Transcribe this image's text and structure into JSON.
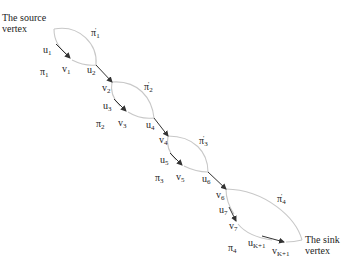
{
  "diagram": {
    "source_label": [
      "The source",
      "vertex"
    ],
    "sink_label": [
      "The sink",
      "vertex"
    ],
    "colors": {
      "curve": "#c8c8c8",
      "arrow": "#333333",
      "text": "#222222"
    },
    "segments": [
      {
        "from": "u1",
        "to": "v1"
      },
      {
        "from": "u2",
        "to": "v2"
      },
      {
        "from": "u3",
        "to": "v3"
      },
      {
        "from": "u4",
        "to": "v4"
      },
      {
        "from": "u5",
        "to": "v5"
      },
      {
        "from": "u6",
        "to": "v6"
      },
      {
        "from": "u7",
        "to": "v7"
      },
      {
        "from": "uK+1",
        "to": "vK+1"
      }
    ],
    "labels": {
      "u1": {
        "base": "u",
        "sub": "1"
      },
      "v1": {
        "base": "v",
        "sub": "1"
      },
      "u2": {
        "base": "u",
        "sub": "2"
      },
      "v2": {
        "base": "v",
        "sub": "2"
      },
      "u3": {
        "base": "u",
        "sub": "3"
      },
      "v3": {
        "base": "v",
        "sub": "3"
      },
      "u4": {
        "base": "u",
        "sub": "4"
      },
      "v4": {
        "base": "v",
        "sub": "4"
      },
      "u5": {
        "base": "u",
        "sub": "5"
      },
      "v5": {
        "base": "v",
        "sub": "5"
      },
      "u6": {
        "base": "u",
        "sub": "6"
      },
      "v6": {
        "base": "v",
        "sub": "6"
      },
      "u7": {
        "base": "u",
        "sub": "7"
      },
      "v7": {
        "base": "v",
        "sub": "7"
      },
      "uK1": {
        "base": "u",
        "sub": "K+1"
      },
      "vK1": {
        "base": "v",
        "sub": "K+1"
      },
      "pi1": {
        "base": "π",
        "sub": "1"
      },
      "pi2": {
        "base": "π",
        "sub": "2"
      },
      "pi3": {
        "base": "π",
        "sub": "3"
      },
      "pi4": {
        "base": "π",
        "sub": "4"
      },
      "pi1p": {
        "base": "π",
        "sup": "'",
        "sub": "1"
      },
      "pi2p": {
        "base": "π",
        "sup": "'",
        "sub": "2"
      },
      "pi3p": {
        "base": "π",
        "sup": "'",
        "sub": "3"
      },
      "pi4p": {
        "base": "π",
        "sup": "'",
        "sub": "4"
      }
    }
  }
}
